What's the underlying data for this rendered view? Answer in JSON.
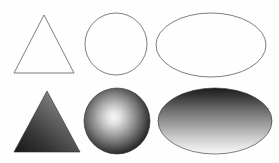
{
  "figure": {
    "title": "Geometric shapes: outline and shaded variants",
    "width": 279,
    "height": 163,
    "background_color": "#fefefe",
    "outline_stroke_color": "#6f6f6f",
    "filled_stroke_color": "#2b2b2b",
    "rows": [
      {
        "row_name": "outline-row",
        "style": "outline",
        "shapes": [
          "triangle",
          "circle",
          "ellipse"
        ]
      },
      {
        "row_name": "shaded-row",
        "style": "gradient-filled",
        "shapes": [
          "triangle",
          "sphere",
          "ellipse"
        ]
      }
    ]
  },
  "shapes": {
    "outline_triangle": {
      "name": "Triangle outline",
      "points": "44,15 74,73 14,73",
      "stroke": "#6f6f6f",
      "fill": "none"
    },
    "outline_circle": {
      "name": "Circle outline",
      "cx": 116,
      "cy": 44,
      "r": 31,
      "stroke": "#6f6f6f",
      "fill": "none"
    },
    "outline_ellipse": {
      "name": "Ellipse outline",
      "cx": 211,
      "cy": 45,
      "rx": 55,
      "ry": 32,
      "stroke": "#6f6f6f",
      "fill": "none"
    },
    "shaded_triangle": {
      "name": "Triangle with linear gradient shading",
      "points": "47,91 80,152 14,152",
      "gradient_type": "linear",
      "gradient_angle": "diagonal, lower-left to upper-right",
      "gradient_stops": [
        "#1d1d1d",
        "#4a4a4a",
        "#8d8d8d"
      ]
    },
    "shaded_sphere": {
      "name": "Sphere with radial gradient shading",
      "cx": 117,
      "cy": 121,
      "r": 33,
      "gradient_type": "radial",
      "highlight_x": "45%",
      "highlight_y": "44%",
      "gradient_stops": [
        "#f2f2f2",
        "#bdbdbd",
        "#6a6a6a",
        "#1a1a1a"
      ]
    },
    "shaded_ellipse": {
      "name": "Ellipse with vertical gradient shading",
      "cx": 215,
      "cy": 121,
      "rx": 57,
      "ry": 33,
      "gradient_type": "linear",
      "gradient_angle": "vertical, top to bottom",
      "gradient_stops": [
        "#1c1c1c",
        "#737373",
        "#c9c9c9",
        "#f6f6f6"
      ]
    }
  }
}
